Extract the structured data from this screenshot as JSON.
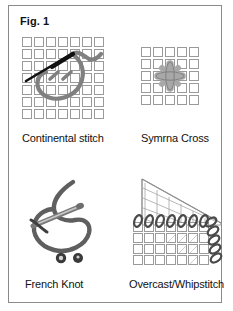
{
  "figure": {
    "title": "Fig. 1",
    "border_color": "#8a8a8a",
    "background": "#ffffff"
  },
  "colors": {
    "grid_line": "#9a9a9a",
    "grid_fill": "#ffffff",
    "thread_gray": "#808080",
    "thread_gray_dark": "#6e6e6e",
    "needle_black": "#111111",
    "star_fill": "#a8a8a8",
    "knot_dark": "#3a3a3a",
    "text": "#111111"
  },
  "panels": [
    {
      "id": "continental-stitch",
      "caption": "Continental stitch",
      "grid": {
        "cols": 7,
        "rows": 7,
        "cell": 11.5
      },
      "elements": [
        "needle-black-diagonal",
        "thread-gray-loop",
        "two-small-diagonal-stitches"
      ]
    },
    {
      "id": "symrna-cross",
      "caption": "Symrna Cross",
      "grid": {
        "cols": 5,
        "rows": 5,
        "cell": 11.5
      },
      "elements": [
        "star-burst-eight-petal"
      ]
    },
    {
      "id": "french-knot",
      "caption": "French Knot",
      "grid": null,
      "elements": [
        "thread-gray-large-loop",
        "needle-gray-diagonal",
        "knot-dot-left",
        "knot-dot-right"
      ]
    },
    {
      "id": "overcast-whipstitch",
      "caption": "Overcast/Whipstitch",
      "grid": {
        "cols": 7,
        "rows": 4,
        "cell": 11.5
      },
      "elements": [
        "angled-back-canvas",
        "front-canvas-grid",
        "whipstitch-loops-top",
        "whipstitch-loops-right"
      ]
    }
  ]
}
